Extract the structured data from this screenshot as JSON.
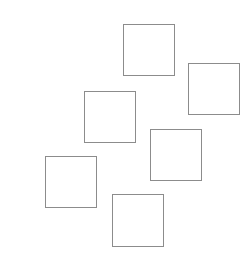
{
  "canvas": {
    "width": 251,
    "height": 257,
    "background": "#ffffff"
  },
  "shapes": {
    "stroke_color": "#8c8c8c",
    "fill_color": "#ffffff",
    "items": [
      {
        "type": "square",
        "x": 123,
        "y": 24,
        "w": 52,
        "h": 52
      },
      {
        "type": "square",
        "x": 188,
        "y": 63,
        "w": 52,
        "h": 52
      },
      {
        "type": "square",
        "x": 84,
        "y": 91,
        "w": 52,
        "h": 52
      },
      {
        "type": "square",
        "x": 150,
        "y": 129,
        "w": 52,
        "h": 52
      },
      {
        "type": "square",
        "x": 45,
        "y": 156,
        "w": 52,
        "h": 52
      },
      {
        "type": "square",
        "x": 112,
        "y": 194,
        "w": 52,
        "h": 53
      }
    ]
  }
}
